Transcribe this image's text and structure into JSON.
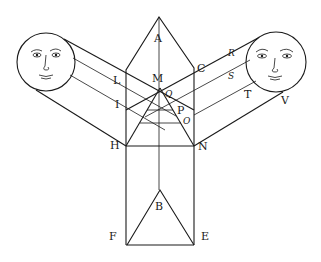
{
  "figure": {
    "labels": {
      "A": "A",
      "M": "M",
      "Q": "Q",
      "C": "C",
      "L": "L",
      "I": "I",
      "P": "P",
      "O": "O",
      "H": "H",
      "N": "N",
      "R": "R",
      "S": "S",
      "T": "T",
      "V": "V",
      "B": "B",
      "F": "F",
      "E": "E"
    },
    "colors": {
      "ink": "#1a1a1a",
      "paper": "#ffffff"
    },
    "suns": [
      {
        "name": "left-sun",
        "cx": 46,
        "cy": 62,
        "r": 29
      },
      {
        "name": "right-sun",
        "cx": 276,
        "cy": 62,
        "r": 30
      }
    ]
  }
}
